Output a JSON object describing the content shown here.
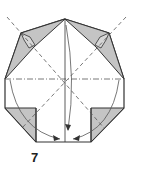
{
  "diagram": {
    "type": "origami-folding-step",
    "step_number": "7",
    "colors": {
      "paper": "#ffffff",
      "colored_side": "#c4c4c4",
      "line": "#333333",
      "guide_line": "#777777"
    }
  }
}
